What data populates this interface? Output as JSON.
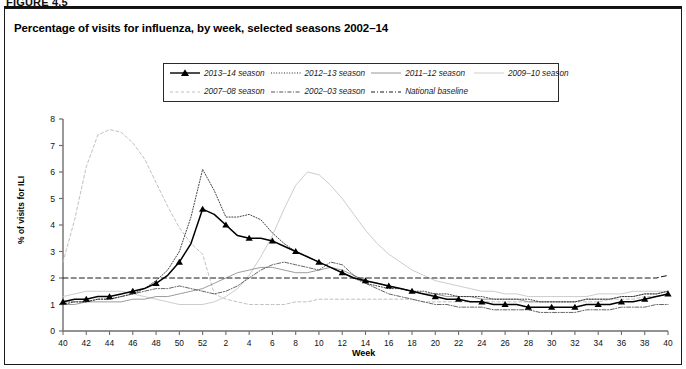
{
  "figure": {
    "number": "FIGURE 4.5",
    "title": "Percentage of visits for influenza, by week, selected seasons 2002–14"
  },
  "axes": {
    "ylabel": "% of visits for ILI",
    "xlabel": "Week",
    "y_ticks": [
      "0",
      "1",
      "2",
      "3",
      "4",
      "5",
      "6",
      "7",
      "8"
    ],
    "x_ticks": [
      "40",
      "42",
      "44",
      "46",
      "48",
      "50",
      "52",
      "2",
      "4",
      "6",
      "8",
      "10",
      "12",
      "14",
      "16",
      "18",
      "20",
      "22",
      "24",
      "26",
      "28",
      "30",
      "32",
      "34",
      "36",
      "38",
      "40"
    ]
  },
  "legend": {
    "items": [
      {
        "label": "2013–14 season",
        "style": "solid-markers",
        "color": "#000000"
      },
      {
        "label": "2012–13 season",
        "style": "dotted",
        "color": "#2b2b2b"
      },
      {
        "label": "2011–12 season",
        "style": "solid-thin",
        "color": "#8a8a8a"
      },
      {
        "label": "2009–10 season",
        "style": "solid-light",
        "color": "#c9c9c9"
      },
      {
        "label": "2007–08 season",
        "style": "dashed-light",
        "color": "#bdbdbd"
      },
      {
        "label": "2002–03 season",
        "style": "dash-dot",
        "color": "#555555"
      },
      {
        "label": "National baseline",
        "style": "dash-dot-dark",
        "color": "#1a1a1a"
      }
    ]
  },
  "chart_data": {
    "type": "line",
    "title": "Percentage of visits for influenza, by week, selected seasons 2002–14",
    "xlabel": "Week",
    "ylabel": "% of visits for ILI",
    "ylim": [
      0,
      8
    ],
    "grid": false,
    "legend_position": "top-center",
    "x": [
      40,
      41,
      42,
      43,
      44,
      45,
      46,
      47,
      48,
      49,
      50,
      51,
      52,
      1,
      2,
      3,
      4,
      5,
      6,
      7,
      8,
      9,
      10,
      11,
      12,
      13,
      14,
      15,
      16,
      17,
      18,
      19,
      20,
      21,
      22,
      23,
      24,
      25,
      26,
      27,
      28,
      29,
      30,
      31,
      32,
      33,
      34,
      35,
      36,
      37,
      38,
      39,
      40
    ],
    "series": [
      {
        "name": "2013–14 season",
        "values": [
          1.1,
          1.2,
          1.2,
          1.3,
          1.3,
          1.4,
          1.5,
          1.6,
          1.8,
          2.1,
          2.6,
          3.3,
          4.6,
          4.4,
          4.0,
          3.6,
          3.5,
          3.5,
          3.4,
          3.2,
          3.0,
          2.8,
          2.6,
          2.4,
          2.2,
          2.0,
          1.9,
          1.8,
          1.7,
          1.6,
          1.5,
          1.4,
          1.3,
          1.2,
          1.2,
          1.1,
          1.1,
          1.0,
          1.0,
          1.0,
          0.9,
          0.9,
          0.9,
          0.9,
          0.9,
          1.0,
          1.0,
          1.0,
          1.1,
          1.1,
          1.2,
          1.3,
          1.4
        ],
        "marker": "triangle",
        "color": "#000000"
      },
      {
        "name": "2012–13 season",
        "values": [
          1.0,
          1.1,
          1.1,
          1.2,
          1.2,
          1.3,
          1.4,
          1.6,
          1.9,
          2.3,
          3.0,
          4.3,
          6.1,
          5.3,
          4.3,
          4.3,
          4.4,
          4.2,
          3.7,
          3.3,
          3.0,
          2.8,
          2.6,
          2.4,
          2.2,
          2.0,
          1.8,
          1.7,
          1.6,
          1.6,
          1.5,
          1.5,
          1.4,
          1.4,
          1.3,
          1.3,
          1.3,
          1.2,
          1.2,
          1.2,
          1.2,
          1.1,
          1.1,
          1.1,
          1.1,
          1.2,
          1.2,
          1.2,
          1.3,
          1.3,
          1.4,
          1.4,
          1.5
        ],
        "color": "#2b2b2b"
      },
      {
        "name": "2011–12 season",
        "values": [
          1.0,
          1.0,
          1.1,
          1.1,
          1.1,
          1.1,
          1.2,
          1.2,
          1.3,
          1.3,
          1.4,
          1.5,
          1.6,
          1.8,
          2.0,
          2.2,
          2.3,
          2.4,
          2.4,
          2.3,
          2.2,
          2.2,
          2.3,
          2.4,
          2.3,
          2.1,
          1.9,
          1.8,
          1.7,
          1.6,
          1.5,
          1.4,
          1.4,
          1.3,
          1.3,
          1.3,
          1.2,
          1.2,
          1.2,
          1.2,
          1.1,
          1.1,
          1.1,
          1.1,
          1.1,
          1.2,
          1.2,
          1.2,
          1.3,
          1.3,
          1.4,
          1.4,
          1.5
        ],
        "color": "#8a8a8a"
      },
      {
        "name": "2009–10 season",
        "values": [
          1.3,
          1.4,
          1.5,
          1.5,
          1.5,
          1.5,
          1.4,
          1.3,
          1.2,
          1.1,
          1.0,
          1.0,
          1.0,
          1.1,
          1.3,
          1.6,
          2.1,
          2.8,
          3.6,
          4.6,
          5.5,
          6.0,
          5.9,
          5.5,
          5.0,
          4.4,
          3.8,
          3.3,
          2.9,
          2.6,
          2.3,
          2.1,
          1.9,
          1.8,
          1.7,
          1.6,
          1.5,
          1.5,
          1.4,
          1.4,
          1.3,
          1.3,
          1.3,
          1.3,
          1.3,
          1.3,
          1.4,
          1.4,
          1.4,
          1.5,
          1.5,
          1.5,
          1.5
        ],
        "color": "#c9c9c9"
      },
      {
        "name": "2007–08 season",
        "values": [
          2.6,
          4.2,
          6.2,
          7.4,
          7.6,
          7.5,
          7.1,
          6.5,
          5.6,
          4.7,
          3.9,
          3.3,
          2.9,
          1.4,
          1.2,
          1.1,
          1.0,
          1.0,
          1.0,
          1.0,
          1.1,
          1.1,
          1.2,
          1.2,
          1.2,
          1.2,
          1.2,
          1.2,
          1.2,
          1.2,
          1.2,
          1.1,
          1.1,
          1.1,
          1.1,
          1.1,
          1.1,
          1.1,
          1.1,
          1.1,
          1.1,
          1.1,
          1.1,
          1.1,
          1.1,
          1.1,
          1.1,
          1.2,
          1.2,
          1.2,
          1.3,
          1.3,
          1.4
        ],
        "color": "#bdbdbd"
      },
      {
        "name": "2002–03 season",
        "values": [
          1.1,
          1.1,
          1.1,
          1.2,
          1.2,
          1.3,
          1.4,
          1.5,
          1.6,
          1.6,
          1.7,
          1.6,
          1.5,
          1.4,
          1.5,
          1.7,
          2.0,
          2.3,
          2.5,
          2.6,
          2.5,
          2.4,
          2.3,
          2.6,
          2.5,
          2.1,
          1.8,
          1.6,
          1.4,
          1.3,
          1.2,
          1.1,
          1.0,
          1.0,
          0.9,
          0.9,
          0.9,
          0.8,
          0.8,
          0.8,
          0.8,
          0.7,
          0.7,
          0.7,
          0.7,
          0.8,
          0.8,
          0.8,
          0.9,
          0.9,
          0.9,
          1.0,
          1.0
        ],
        "color": "#555555"
      },
      {
        "name": "National baseline",
        "values": [
          2.0,
          2.0,
          2.0,
          2.0,
          2.0,
          2.0,
          2.0,
          2.0,
          2.0,
          2.0,
          2.0,
          2.0,
          2.0,
          2.0,
          2.0,
          2.0,
          2.0,
          2.0,
          2.0,
          2.0,
          2.0,
          2.0,
          2.0,
          2.0,
          2.0,
          2.0,
          2.0,
          2.0,
          2.0,
          2.0,
          2.0,
          2.0,
          2.0,
          2.0,
          2.0,
          2.0,
          2.0,
          2.0,
          2.0,
          2.0,
          2.0,
          2.0,
          2.0,
          2.0,
          2.0,
          2.0,
          2.0,
          2.0,
          2.0,
          2.0,
          2.0,
          2.0,
          2.1
        ],
        "color": "#1a1a1a",
        "constant": true
      }
    ]
  }
}
